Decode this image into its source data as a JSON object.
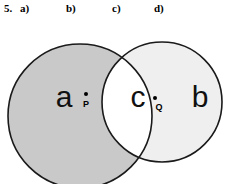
{
  "question": {
    "number": "5.",
    "parts": [
      {
        "label": "a)"
      },
      {
        "label": "b)"
      },
      {
        "label": "c)"
      },
      {
        "label": "d)"
      }
    ]
  },
  "diagram": {
    "type": "venn-two-set",
    "colors": {
      "left_circle_fill": "#c9c9c9",
      "right_circle_fill": "#efefef",
      "lens_fill": "#ffffff",
      "outline": "#1a1a1a",
      "background": "#ffffff",
      "text": "#111111"
    },
    "circles": {
      "left": {
        "cx": 80,
        "cy": 116,
        "r": 72
      },
      "right": {
        "cx": 162,
        "cy": 102,
        "r": 60
      }
    },
    "regions": [
      {
        "name": "left-only",
        "letter": "a",
        "x": 64,
        "y": 97
      },
      {
        "name": "intersection",
        "letter": "c",
        "x": 138,
        "y": 97
      },
      {
        "name": "right-only",
        "letter": "b",
        "x": 200,
        "y": 97
      }
    ],
    "points": [
      {
        "name": "P",
        "label": "P",
        "dot_x": 86,
        "dot_y": 94,
        "label_x": 86,
        "label_y": 104
      },
      {
        "name": "Q",
        "label": "Q",
        "dot_x": 155,
        "dot_y": 98,
        "label_x": 159,
        "label_y": 107
      }
    ]
  }
}
